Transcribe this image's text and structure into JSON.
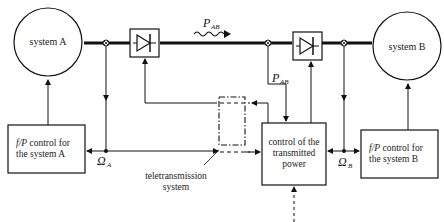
{
  "nodes": {
    "system_a": {
      "label": "system A"
    },
    "system_b": {
      "label": "system B"
    },
    "fp_control_a": {
      "line1_italic": "f/P",
      "line1_rest": " control for",
      "line2": "the system A"
    },
    "fp_control_b": {
      "line1_italic": "f/P",
      "line1_rest": " control for",
      "line2": "the system B"
    },
    "power_control": {
      "line1": "control of the",
      "line2": "transmitted",
      "line3": "power"
    },
    "teletransmission": {
      "line1": "teletransmission",
      "line2": "system"
    }
  },
  "symbols": {
    "p_ab_top": {
      "main": "P",
      "sub": "AB"
    },
    "p_ab_side": {
      "main": "P",
      "sub": "AB"
    },
    "omega_a": {
      "main": "Ω",
      "sub": "A"
    },
    "omega_b": {
      "main": "Ω",
      "sub": "B"
    }
  },
  "colors": {
    "line": "#111111",
    "background": "#ffffff"
  }
}
